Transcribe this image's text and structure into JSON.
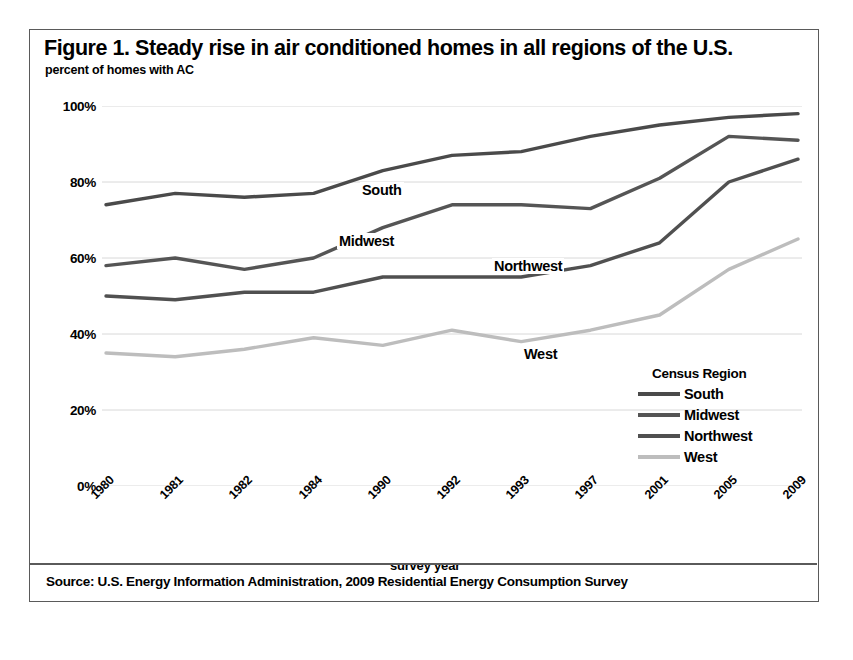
{
  "figure": {
    "title": "Figure 1. Steady rise in air conditioned homes in all regions of the U.S.",
    "subtitle": "percent of homes with AC",
    "source": "Source:  U.S. Energy Information Administration, 2009 Residential Energy Consumption Survey"
  },
  "legend": {
    "title": "Census Region",
    "position": "inside-right"
  },
  "annotations": [
    {
      "label": "South"
    },
    {
      "label": "Midwest"
    },
    {
      "label": "Northwest"
    },
    {
      "label": "West"
    }
  ],
  "chart_data": {
    "type": "line",
    "title": "Figure 1. Steady rise in air conditioned homes in all regions of the U.S.",
    "subtitle": "percent of homes with AC",
    "xlabel": "survey year",
    "ylabel": "percent of homes with AC",
    "categories": [
      "1980",
      "1981",
      "1982",
      "1984",
      "1990",
      "1992",
      "1993",
      "1997",
      "2001",
      "2005",
      "2009"
    ],
    "ytick_labels": [
      "0%",
      "20%",
      "40%",
      "60%",
      "80%",
      "100%"
    ],
    "ytick_values": [
      0,
      20,
      40,
      60,
      80,
      100
    ],
    "ylim": [
      0,
      100
    ],
    "grid": true,
    "legend_title": "Census Region",
    "series": [
      {
        "name": "South",
        "color": "#4a4a4a",
        "values": [
          74,
          77,
          76,
          77,
          83,
          87,
          88,
          92,
          95,
          97,
          98
        ]
      },
      {
        "name": "Midwest",
        "color": "#555555",
        "values": [
          58,
          60,
          57,
          60,
          68,
          74,
          74,
          73,
          81,
          92,
          91
        ]
      },
      {
        "name": "Northwest",
        "color": "#505050",
        "values": [
          50,
          49,
          51,
          51,
          55,
          55,
          55,
          58,
          64,
          80,
          86
        ]
      },
      {
        "name": "West",
        "color": "#bdbdbd",
        "values": [
          35,
          34,
          36,
          39,
          37,
          41,
          38,
          41,
          45,
          57,
          65
        ]
      }
    ]
  }
}
